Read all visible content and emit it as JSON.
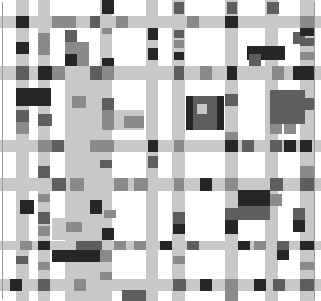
{
  "colors": {
    "L": "#c8c8c8",
    "M": "#8a8a8a",
    "D": "#5e5e5e",
    "K": "#262626",
    "W": "#ffffff"
  },
  "rects": [
    {
      "x": 0,
      "y": 16,
      "w": 321,
      "h": 12,
      "c": "L"
    },
    {
      "x": 0,
      "y": 66,
      "w": 321,
      "h": 14,
      "c": "L"
    },
    {
      "x": 0,
      "y": 140,
      "w": 321,
      "h": 12,
      "c": "L"
    },
    {
      "x": 0,
      "y": 178,
      "w": 321,
      "h": 13,
      "c": "L"
    },
    {
      "x": 0,
      "y": 241,
      "w": 321,
      "h": 9,
      "c": "L"
    },
    {
      "x": 0,
      "y": 279,
      "w": 321,
      "h": 12,
      "c": "L"
    },
    {
      "x": 16,
      "y": 0,
      "w": 13,
      "h": 301,
      "c": "L"
    },
    {
      "x": 38,
      "y": 0,
      "w": 12,
      "h": 301,
      "c": "L"
    },
    {
      "x": 65,
      "y": 66,
      "w": 35,
      "h": 235,
      "c": "L"
    },
    {
      "x": 100,
      "y": 0,
      "w": 12,
      "h": 301,
      "c": "L"
    },
    {
      "x": 146,
      "y": 0,
      "w": 12,
      "h": 301,
      "c": "L"
    },
    {
      "x": 172,
      "y": 0,
      "w": 13,
      "h": 301,
      "c": "L"
    },
    {
      "x": 225,
      "y": 0,
      "w": 13,
      "h": 301,
      "c": "L"
    },
    {
      "x": 265,
      "y": 0,
      "w": 13,
      "h": 301,
      "c": "L"
    },
    {
      "x": 300,
      "y": 0,
      "w": 15,
      "h": 301,
      "c": "L"
    },
    {
      "x": 114,
      "y": 110,
      "w": 30,
      "h": 20,
      "c": "L"
    },
    {
      "x": 52,
      "y": 218,
      "w": 46,
      "h": 22,
      "c": "L"
    },
    {
      "x": 102,
      "y": 0,
      "w": 12,
      "h": 14,
      "c": "K"
    },
    {
      "x": 148,
      "y": 2,
      "w": 10,
      "h": 12,
      "c": "L"
    },
    {
      "x": 148,
      "y": 28,
      "w": 10,
      "h": 12,
      "c": "K"
    },
    {
      "x": 174,
      "y": 2,
      "w": 10,
      "h": 12,
      "c": "D"
    },
    {
      "x": 227,
      "y": 2,
      "w": 10,
      "h": 12,
      "c": "D"
    },
    {
      "x": 267,
      "y": 2,
      "w": 12,
      "h": 12,
      "c": "D"
    },
    {
      "x": 16,
      "y": 16,
      "w": 13,
      "h": 12,
      "c": "K"
    },
    {
      "x": 52,
      "y": 16,
      "w": 24,
      "h": 12,
      "c": "M"
    },
    {
      "x": 90,
      "y": 16,
      "w": 10,
      "h": 12,
      "c": "D"
    },
    {
      "x": 116,
      "y": 16,
      "w": 12,
      "h": 12,
      "c": "M"
    },
    {
      "x": 187,
      "y": 16,
      "w": 12,
      "h": 12,
      "c": "M"
    },
    {
      "x": 225,
      "y": 16,
      "w": 13,
      "h": 12,
      "c": "K"
    },
    {
      "x": 300,
      "y": 16,
      "w": 15,
      "h": 12,
      "c": "M"
    },
    {
      "x": 38,
      "y": 33,
      "w": 12,
      "h": 22,
      "c": "M"
    },
    {
      "x": 65,
      "y": 30,
      "w": 12,
      "h": 12,
      "c": "D"
    },
    {
      "x": 65,
      "y": 42,
      "w": 24,
      "h": 12,
      "c": "M"
    },
    {
      "x": 16,
      "y": 42,
      "w": 13,
      "h": 12,
      "c": "K"
    },
    {
      "x": 65,
      "y": 54,
      "w": 12,
      "h": 12,
      "c": "K"
    },
    {
      "x": 77,
      "y": 54,
      "w": 12,
      "h": 12,
      "c": "M"
    },
    {
      "x": 102,
      "y": 28,
      "w": 10,
      "h": 6,
      "c": "M"
    },
    {
      "x": 102,
      "y": 58,
      "w": 12,
      "h": 8,
      "c": "K"
    },
    {
      "x": 174,
      "y": 30,
      "w": 10,
      "h": 8,
      "c": "D"
    },
    {
      "x": 174,
      "y": 40,
      "w": 10,
      "h": 8,
      "c": "M"
    },
    {
      "x": 174,
      "y": 52,
      "w": 10,
      "h": 8,
      "c": "K"
    },
    {
      "x": 148,
      "y": 28,
      "w": 10,
      "h": 10,
      "c": "K"
    },
    {
      "x": 148,
      "y": 48,
      "w": 10,
      "h": 12,
      "c": "K"
    },
    {
      "x": 247,
      "y": 46,
      "w": 38,
      "h": 14,
      "c": "K"
    },
    {
      "x": 249,
      "y": 54,
      "w": 12,
      "h": 12,
      "c": "D"
    },
    {
      "x": 293,
      "y": 32,
      "w": 12,
      "h": 12,
      "c": "D"
    },
    {
      "x": 300,
      "y": 28,
      "w": 15,
      "h": 8,
      "c": "K"
    },
    {
      "x": 300,
      "y": 38,
      "w": 15,
      "h": 8,
      "c": "D"
    },
    {
      "x": 300,
      "y": 52,
      "w": 15,
      "h": 8,
      "c": "M"
    },
    {
      "x": 16,
      "y": 66,
      "w": 13,
      "h": 14,
      "c": "D"
    },
    {
      "x": 38,
      "y": 66,
      "w": 14,
      "h": 14,
      "c": "K"
    },
    {
      "x": 52,
      "y": 66,
      "w": 13,
      "h": 14,
      "c": "M"
    },
    {
      "x": 90,
      "y": 66,
      "w": 12,
      "h": 14,
      "c": "D"
    },
    {
      "x": 102,
      "y": 66,
      "w": 12,
      "h": 14,
      "c": "M"
    },
    {
      "x": 174,
      "y": 66,
      "w": 10,
      "h": 14,
      "c": "D"
    },
    {
      "x": 200,
      "y": 66,
      "w": 12,
      "h": 14,
      "c": "M"
    },
    {
      "x": 227,
      "y": 66,
      "w": 10,
      "h": 14,
      "c": "K"
    },
    {
      "x": 272,
      "y": 66,
      "w": 12,
      "h": 14,
      "c": "M"
    },
    {
      "x": 293,
      "y": 66,
      "w": 12,
      "h": 14,
      "c": "K"
    },
    {
      "x": 300,
      "y": 66,
      "w": 15,
      "h": 14,
      "c": "K"
    },
    {
      "x": 16,
      "y": 88,
      "w": 35,
      "h": 18,
      "c": "K"
    },
    {
      "x": 72,
      "y": 96,
      "w": 14,
      "h": 12,
      "c": "M"
    },
    {
      "x": 102,
      "y": 98,
      "w": 12,
      "h": 12,
      "c": "D"
    },
    {
      "x": 102,
      "y": 110,
      "w": 12,
      "h": 20,
      "c": "M"
    },
    {
      "x": 124,
      "y": 116,
      "w": 20,
      "h": 12,
      "c": "M"
    },
    {
      "x": 16,
      "y": 110,
      "w": 13,
      "h": 12,
      "c": "D"
    },
    {
      "x": 38,
      "y": 114,
      "w": 14,
      "h": 12,
      "c": "D"
    },
    {
      "x": 16,
      "y": 122,
      "w": 13,
      "h": 12,
      "c": "M"
    },
    {
      "x": 186,
      "y": 96,
      "w": 38,
      "h": 34,
      "c": "K"
    },
    {
      "x": 193,
      "y": 96,
      "w": 24,
      "h": 34,
      "c": "D"
    },
    {
      "x": 197,
      "y": 104,
      "w": 10,
      "h": 10,
      "c": "L"
    },
    {
      "x": 225,
      "y": 94,
      "w": 13,
      "h": 12,
      "c": "D"
    },
    {
      "x": 225,
      "y": 132,
      "w": 13,
      "h": 8,
      "c": "M"
    },
    {
      "x": 270,
      "y": 90,
      "w": 35,
      "h": 34,
      "c": "D"
    },
    {
      "x": 270,
      "y": 124,
      "w": 12,
      "h": 10,
      "c": "M"
    },
    {
      "x": 284,
      "y": 124,
      "w": 12,
      "h": 10,
      "c": "M"
    },
    {
      "x": 300,
      "y": 98,
      "w": 15,
      "h": 12,
      "c": "D"
    },
    {
      "x": 38,
      "y": 140,
      "w": 14,
      "h": 12,
      "c": "M"
    },
    {
      "x": 52,
      "y": 140,
      "w": 12,
      "h": 12,
      "c": "D"
    },
    {
      "x": 38,
      "y": 140,
      "w": 12,
      "h": 12,
      "c": "M"
    },
    {
      "x": 90,
      "y": 140,
      "w": 24,
      "h": 12,
      "c": "M"
    },
    {
      "x": 148,
      "y": 140,
      "w": 10,
      "h": 12,
      "c": "K"
    },
    {
      "x": 174,
      "y": 140,
      "w": 10,
      "h": 12,
      "c": "M"
    },
    {
      "x": 225,
      "y": 140,
      "w": 13,
      "h": 12,
      "c": "K"
    },
    {
      "x": 242,
      "y": 140,
      "w": 12,
      "h": 12,
      "c": "D"
    },
    {
      "x": 270,
      "y": 140,
      "w": 12,
      "h": 12,
      "c": "D"
    },
    {
      "x": 284,
      "y": 140,
      "w": 12,
      "h": 12,
      "c": "K"
    },
    {
      "x": 300,
      "y": 140,
      "w": 12,
      "h": 12,
      "c": "K"
    },
    {
      "x": 38,
      "y": 166,
      "w": 12,
      "h": 12,
      "c": "D"
    },
    {
      "x": 100,
      "y": 160,
      "w": 12,
      "h": 8,
      "c": "D"
    },
    {
      "x": 148,
      "y": 156,
      "w": 10,
      "h": 12,
      "c": "D"
    },
    {
      "x": 300,
      "y": 166,
      "w": 15,
      "h": 12,
      "c": "M"
    },
    {
      "x": 52,
      "y": 178,
      "w": 14,
      "h": 13,
      "c": "D"
    },
    {
      "x": 70,
      "y": 178,
      "w": 14,
      "h": 13,
      "c": "M"
    },
    {
      "x": 114,
      "y": 178,
      "w": 14,
      "h": 13,
      "c": "M"
    },
    {
      "x": 134,
      "y": 178,
      "w": 14,
      "h": 13,
      "c": "M"
    },
    {
      "x": 174,
      "y": 178,
      "w": 10,
      "h": 13,
      "c": "M"
    },
    {
      "x": 200,
      "y": 178,
      "w": 12,
      "h": 13,
      "c": "K"
    },
    {
      "x": 225,
      "y": 178,
      "w": 13,
      "h": 13,
      "c": "M"
    },
    {
      "x": 270,
      "y": 178,
      "w": 13,
      "h": 13,
      "c": "D"
    },
    {
      "x": 300,
      "y": 178,
      "w": 15,
      "h": 13,
      "c": "D"
    },
    {
      "x": 38,
      "y": 194,
      "w": 12,
      "h": 8,
      "c": "M"
    },
    {
      "x": 20,
      "y": 200,
      "w": 14,
      "h": 14,
      "c": "K"
    },
    {
      "x": 90,
      "y": 200,
      "w": 12,
      "h": 14,
      "c": "K"
    },
    {
      "x": 104,
      "y": 210,
      "w": 12,
      "h": 8,
      "c": "M"
    },
    {
      "x": 238,
      "y": 190,
      "w": 32,
      "h": 16,
      "c": "K"
    },
    {
      "x": 270,
      "y": 194,
      "w": 12,
      "h": 12,
      "c": "M"
    },
    {
      "x": 225,
      "y": 208,
      "w": 13,
      "h": 12,
      "c": "D"
    },
    {
      "x": 238,
      "y": 206,
      "w": 32,
      "h": 14,
      "c": "D"
    },
    {
      "x": 173,
      "y": 212,
      "w": 12,
      "h": 12,
      "c": "D"
    },
    {
      "x": 173,
      "y": 224,
      "w": 12,
      "h": 10,
      "c": "K"
    },
    {
      "x": 38,
      "y": 212,
      "w": 12,
      "h": 12,
      "c": "D"
    },
    {
      "x": 38,
      "y": 226,
      "w": 12,
      "h": 10,
      "c": "M"
    },
    {
      "x": 66,
      "y": 222,
      "w": 16,
      "h": 10,
      "c": "M"
    },
    {
      "x": 102,
      "y": 228,
      "w": 12,
      "h": 12,
      "c": "K"
    },
    {
      "x": 225,
      "y": 220,
      "w": 13,
      "h": 14,
      "c": "K"
    },
    {
      "x": 293,
      "y": 208,
      "w": 12,
      "h": 12,
      "c": "D"
    },
    {
      "x": 293,
      "y": 220,
      "w": 12,
      "h": 12,
      "c": "K"
    },
    {
      "x": 20,
      "y": 241,
      "w": 12,
      "h": 9,
      "c": "M"
    },
    {
      "x": 38,
      "y": 241,
      "w": 12,
      "h": 9,
      "c": "K"
    },
    {
      "x": 76,
      "y": 241,
      "w": 26,
      "h": 9,
      "c": "D"
    },
    {
      "x": 114,
      "y": 241,
      "w": 12,
      "h": 9,
      "c": "M"
    },
    {
      "x": 134,
      "y": 241,
      "w": 12,
      "h": 9,
      "c": "M"
    },
    {
      "x": 160,
      "y": 241,
      "w": 12,
      "h": 9,
      "c": "K"
    },
    {
      "x": 187,
      "y": 241,
      "w": 12,
      "h": 9,
      "c": "D"
    },
    {
      "x": 238,
      "y": 241,
      "w": 12,
      "h": 9,
      "c": "K"
    },
    {
      "x": 254,
      "y": 241,
      "w": 12,
      "h": 9,
      "c": "M"
    },
    {
      "x": 277,
      "y": 241,
      "w": 12,
      "h": 9,
      "c": "D"
    },
    {
      "x": 300,
      "y": 241,
      "w": 15,
      "h": 9,
      "c": "K"
    },
    {
      "x": 52,
      "y": 250,
      "w": 48,
      "h": 12,
      "c": "K"
    },
    {
      "x": 100,
      "y": 250,
      "w": 12,
      "h": 12,
      "c": "M"
    },
    {
      "x": 277,
      "y": 250,
      "w": 12,
      "h": 10,
      "c": "K"
    },
    {
      "x": 173,
      "y": 256,
      "w": 12,
      "h": 8,
      "c": "M"
    },
    {
      "x": 16,
      "y": 256,
      "w": 12,
      "h": 8,
      "c": "D"
    },
    {
      "x": 38,
      "y": 262,
      "w": 12,
      "h": 8,
      "c": "M"
    },
    {
      "x": 100,
      "y": 272,
      "w": 12,
      "h": 8,
      "c": "M"
    },
    {
      "x": 300,
      "y": 262,
      "w": 15,
      "h": 8,
      "c": "M"
    },
    {
      "x": 10,
      "y": 279,
      "w": 12,
      "h": 12,
      "c": "K"
    },
    {
      "x": 38,
      "y": 279,
      "w": 12,
      "h": 12,
      "c": "D"
    },
    {
      "x": 74,
      "y": 279,
      "w": 12,
      "h": 12,
      "c": "M"
    },
    {
      "x": 173,
      "y": 279,
      "w": 10,
      "h": 12,
      "c": "D"
    },
    {
      "x": 200,
      "y": 279,
      "w": 12,
      "h": 12,
      "c": "D"
    },
    {
      "x": 174,
      "y": 279,
      "w": 12,
      "h": 12,
      "c": "D"
    },
    {
      "x": 200,
      "y": 279,
      "w": 12,
      "h": 12,
      "c": "K"
    },
    {
      "x": 225,
      "y": 279,
      "w": 13,
      "h": 12,
      "c": "M"
    },
    {
      "x": 254,
      "y": 279,
      "w": 12,
      "h": 12,
      "c": "K"
    },
    {
      "x": 273,
      "y": 279,
      "w": 12,
      "h": 12,
      "c": "D"
    },
    {
      "x": 300,
      "y": 279,
      "w": 15,
      "h": 12,
      "c": "D"
    },
    {
      "x": 122,
      "y": 290,
      "w": 24,
      "h": 11,
      "c": "D"
    },
    {
      "x": 225,
      "y": 291,
      "w": 13,
      "h": 10,
      "c": "M"
    }
  ]
}
